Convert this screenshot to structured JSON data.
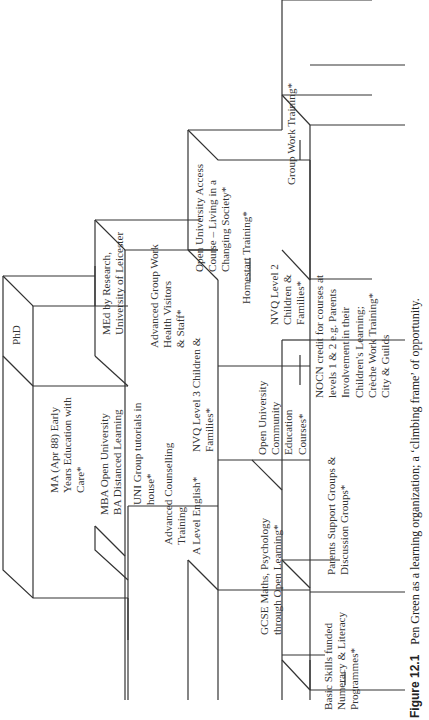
{
  "figure": {
    "number": "Figure 12.1",
    "caption": "Pen Green as a learning organization; a ‘climbing frame’ of opportunity."
  },
  "diagram": {
    "type": "staircase / climbing frame",
    "orientation": "rotated 90° counter-clockwise",
    "levels": [
      {
        "name": "level-1",
        "items": [
          "Basic Skills funded\nNumeracy & Literacy\nProgrammes*"
        ]
      },
      {
        "name": "level-2",
        "items": [
          "GCSE Maths, Psychology\nthrough Open Learning*",
          "Parents Support Groups &\nDiscussion Groups*"
        ]
      },
      {
        "name": "level-3",
        "items": [
          "A Level English*",
          "Open University\nCommunity\nEducation\nCourses*",
          "NOCN credit for courses at\nlevels 1 & 2 e.g. Parents\nInvolvement in their\nChildren's Learning;\nCrèche Work Training*\nCity & Guilds"
        ]
      },
      {
        "name": "level-4",
        "items": [
          "UNI Group tutorials in\nhouse*",
          "Advanced Counselling\nTraining",
          "NVQ Level 3 Children &\nFamilies*",
          "Homestart Training*",
          "NVQ Level 2\nChildren &\nFamilies*",
          "Group Work Training*"
        ]
      },
      {
        "name": "level-5",
        "items": [
          "MBA Open University\nBA Distanced Learning",
          "Advanced Group Work\nHealth Visitors\n& Staff*",
          "Open University Access\nCourse – Living in a\nChanging Society*"
        ]
      },
      {
        "name": "level-6",
        "items": [
          "MA (Apr 88) Early\nYears Education with\nCare*",
          "MEd by Research,\nUniversity of Leicester"
        ]
      },
      {
        "name": "level-7",
        "items": [
          "PhD"
        ]
      }
    ]
  },
  "labels": {
    "phd": "PhD",
    "ma": "MA (Apr 88) Early\nYears Education with\nCare*",
    "med": "MEd by Research,\nUniversity of Leicester",
    "mba": "MBA Open University\nBA Distanced Learning",
    "uni": "UNI Group tutorials in\nhouse*",
    "adv_couns": "Advanced Counselling\nTraining",
    "a_level": "A Level English*",
    "adv_group": "Advanced Group Work\nHealth Visitors\n& Staff*",
    "nvq3": "NVQ Level 3 Children &\nFamilies*",
    "ou_access": "Open University Access\nCourse – Living in a\nChanging Society*",
    "homestart": "Homestart Training*",
    "nvq2": "NVQ Level 2\nChildren &\nFamilies*",
    "group_work": "Group Work Training*",
    "gcse": "GCSE Maths, Psychology\nthrough Open Learning*",
    "ou_comm": "Open University\nCommunity\nEducation\nCourses*",
    "parents": "Parents Support Groups &\nDiscussion Groups*",
    "nocn": "NOCN credit for courses at\nlevels 1 & 2 e.g. Parents\nInvolvement in their\nChildren's Learning;\nCrèche Work Training*\nCity & Guilds",
    "basic": "Basic Skills funded\nNumeracy & Literacy\nProgrammes*"
  }
}
